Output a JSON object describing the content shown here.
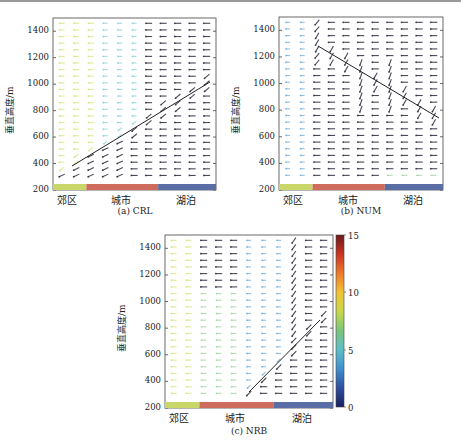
{
  "y_axis": {
    "label": "垂直高度/m",
    "ticks": [
      "1400",
      "1200",
      "1000",
      "800",
      "600",
      "400",
      "200"
    ]
  },
  "regions": [
    {
      "label": "郊区",
      "color": "#c8d66a"
    },
    {
      "label": "城市",
      "color": "#cf6b5c"
    },
    {
      "label": "湖泊",
      "color": "#5a6ea5"
    }
  ],
  "panels": [
    {
      "id": "a",
      "caption": "(a) CRL"
    },
    {
      "id": "b",
      "caption": "(b) NUM"
    },
    {
      "id": "c",
      "caption": "(c) NRB"
    }
  ],
  "colorbar": {
    "ticks": [
      "15",
      "10",
      "5",
      "0"
    ],
    "min": 0,
    "max": 15,
    "colors": [
      "#1a1f5e",
      "#2d4fa0",
      "#3f8fcf",
      "#5cc0c8",
      "#7cc47a",
      "#c7d94a",
      "#f2c235",
      "#ef7a2a",
      "#c93323",
      "#6b1a1a"
    ]
  },
  "chart_data": [
    {
      "type": "quiver",
      "title": "(a) CRL",
      "xlabel": "",
      "ylabel": "垂直高度/m",
      "ylim": [
        200,
        1500
      ],
      "x_regions": [
        "郊区",
        "城市",
        "湖泊"
      ],
      "y_ticks": [
        200,
        400,
        600,
        800,
        1000,
        1200,
        1400
      ],
      "colorbar": {
        "label": "wind speed",
        "range": [
          0,
          15
        ]
      },
      "annotation_line": {
        "from_height_m": 380,
        "to_height_m": 1020,
        "direction": "rising toward lake"
      }
    },
    {
      "type": "quiver",
      "title": "(b) NUM",
      "xlabel": "",
      "ylabel": "垂直高度/m",
      "ylim": [
        200,
        1500
      ],
      "x_regions": [
        "郊区",
        "城市",
        "湖泊"
      ],
      "y_ticks": [
        200,
        400,
        600,
        800,
        1000,
        1200,
        1400
      ],
      "colorbar": {
        "label": "wind speed",
        "range": [
          0,
          15
        ]
      },
      "annotation_line": {
        "from_height_m": 1280,
        "to_height_m": 740,
        "direction": "descending toward lake"
      }
    },
    {
      "type": "quiver",
      "title": "(c) NRB",
      "xlabel": "",
      "ylabel": "垂直高度/m",
      "ylim": [
        200,
        1500
      ],
      "x_regions": [
        "郊区",
        "城市",
        "湖泊"
      ],
      "y_ticks": [
        200,
        400,
        600,
        800,
        1000,
        1200,
        1400
      ],
      "colorbar": {
        "label": "wind speed",
        "range": [
          0,
          15
        ],
        "ticks": [
          0,
          5,
          10,
          15
        ]
      },
      "annotation_line": {
        "from_height_m": 290,
        "to_height_m": 860,
        "direction": "rising toward lake"
      }
    }
  ]
}
